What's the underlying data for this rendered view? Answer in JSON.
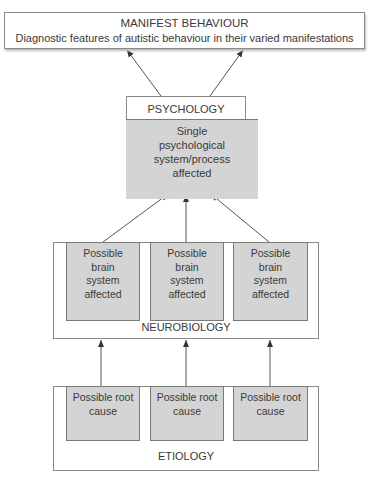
{
  "manifest": {
    "title": "MANIFEST BEHAVIOUR",
    "subtitle": "Diagnostic features of autistic behaviour in their varied manifestations"
  },
  "psychology": {
    "title": "PSYCHOLOGY",
    "body": "Single psychological system/process affected"
  },
  "neurobiology": {
    "title": "NEUROBIOLOGY",
    "boxes": [
      {
        "label": "Possible brain system affected"
      },
      {
        "label": "Possible brain system affected"
      },
      {
        "label": "Possible brain system affected"
      }
    ]
  },
  "etiology": {
    "title": "ETIOLOGY",
    "boxes": [
      {
        "label": "Possible root cause"
      },
      {
        "label": "Possible root cause"
      },
      {
        "label": "Possible root cause"
      }
    ]
  },
  "colors": {
    "box_fill": "#d4d4d4",
    "border": "#8a8a8a",
    "text": "#3a3a3a"
  }
}
